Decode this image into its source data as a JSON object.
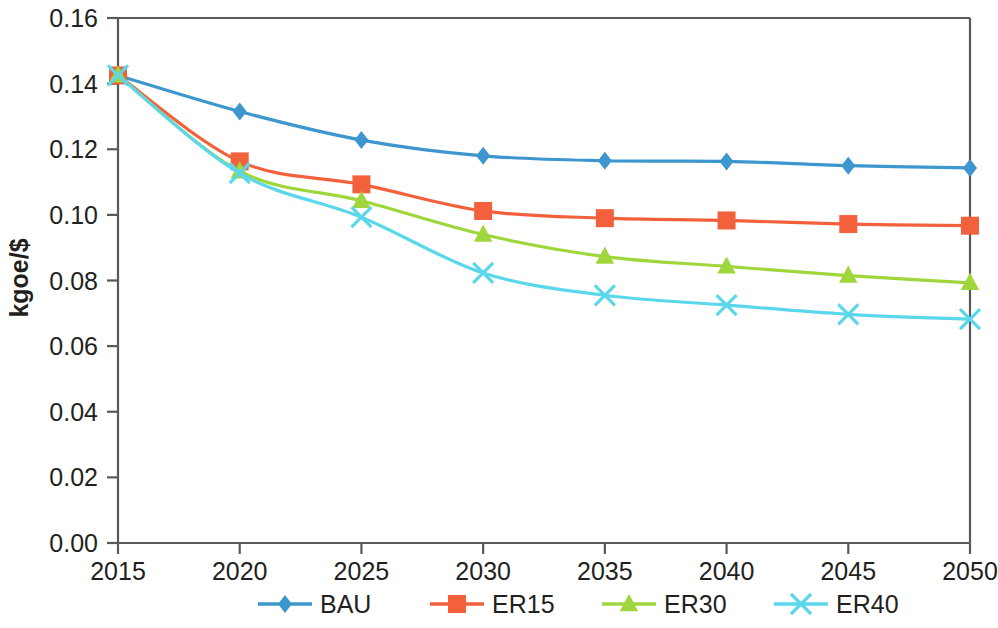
{
  "chart_data": {
    "type": "line",
    "title": "",
    "xlabel": "",
    "ylabel": "kgoe/$",
    "x": [
      2015,
      2020,
      2025,
      2030,
      2035,
      2040,
      2045,
      2050
    ],
    "xtick_labels": [
      "2015",
      "2020",
      "2025",
      "2030",
      "2035",
      "2040",
      "2045",
      "2050"
    ],
    "ytick_labels": [
      "0.00",
      "0.02",
      "0.04",
      "0.06",
      "0.08",
      "0.10",
      "0.12",
      "0.14",
      "0.16"
    ],
    "ytick_values": [
      0.0,
      0.02,
      0.04,
      0.06,
      0.08,
      0.1,
      0.12,
      0.14,
      0.16
    ],
    "xlim": [
      2015,
      2050
    ],
    "ylim": [
      0.0,
      0.16
    ],
    "grid": false,
    "legend_position": "bottom",
    "series": [
      {
        "name": "BAU",
        "color": "#3D96CE",
        "marker": "diamond",
        "values": [
          0.1425,
          0.1315,
          0.1228,
          0.118,
          0.1165,
          0.1163,
          0.115,
          0.1143
        ]
      },
      {
        "name": "ER15",
        "color": "#F3603C",
        "marker": "square",
        "values": [
          0.1425,
          0.1163,
          0.1093,
          0.1012,
          0.099,
          0.0983,
          0.0972,
          0.0967
        ]
      },
      {
        "name": "ER30",
        "color": "#9FD63C",
        "marker": "triangle",
        "values": [
          0.1425,
          0.1133,
          0.1043,
          0.094,
          0.0873,
          0.0843,
          0.0815,
          0.0793
        ]
      },
      {
        "name": "ER40",
        "color": "#5BD7EC",
        "marker": "cross",
        "values": [
          0.1425,
          0.1127,
          0.0993,
          0.0823,
          0.0755,
          0.0725,
          0.0697,
          0.0682
        ]
      }
    ]
  },
  "legend": {
    "items": [
      {
        "label": "BAU"
      },
      {
        "label": "ER15"
      },
      {
        "label": "ER30"
      },
      {
        "label": "ER40"
      }
    ]
  },
  "axis": {
    "y_title": "kgoe/$"
  },
  "colors": {
    "axis": "#595959",
    "text": "#231f20",
    "bau": "#3D96CE",
    "er15": "#F3603C",
    "er30": "#9FD63C",
    "er40": "#5BD7EC"
  }
}
